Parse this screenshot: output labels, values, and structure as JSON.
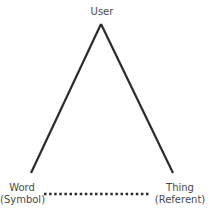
{
  "diagram": {
    "title": "",
    "nodes": {
      "top": {
        "label": "User"
      },
      "left": {
        "line1": "Word",
        "line2": "(Symbol)"
      },
      "right": {
        "line1": "Thing",
        "line2": "(Referent)"
      }
    },
    "edges": [
      {
        "from": "top",
        "to": "left",
        "style": "solid"
      },
      {
        "from": "top",
        "to": "right",
        "style": "solid"
      },
      {
        "from": "left",
        "to": "right",
        "style": "dotted"
      }
    ],
    "colors": {
      "line": "#2b2b2b",
      "text": "#4a4a4a"
    }
  }
}
